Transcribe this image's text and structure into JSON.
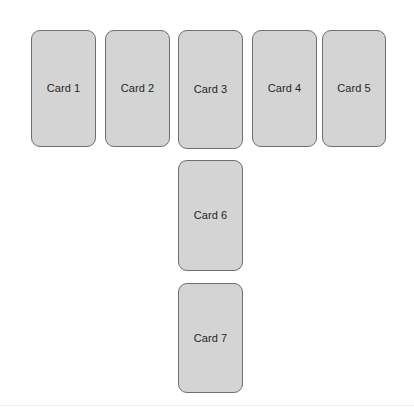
{
  "canvas": {
    "width": 414,
    "height": 417,
    "background_color": "#ffffff"
  },
  "style": {
    "card_fill_color": "#d4d4d4",
    "card_border_color": "#6f6f6f",
    "card_text_color": "#262626",
    "divider_color": "#f0f0f0"
  },
  "layout": {
    "top_row_count": 5,
    "column_count": 2,
    "description": "Five cards in a horizontal row with two additional cards stacked vertically below the third card, forming a T shape."
  },
  "cards": [
    {
      "label": "Card 1",
      "row": "top",
      "index": 1
    },
    {
      "label": "Card 2",
      "row": "top",
      "index": 2
    },
    {
      "label": "Card 3",
      "row": "top",
      "index": 3
    },
    {
      "label": "Card 4",
      "row": "top",
      "index": 4
    },
    {
      "label": "Card 5",
      "row": "top",
      "index": 5
    },
    {
      "label": "Card 6",
      "row": "column",
      "index": 6
    },
    {
      "label": "Card 7",
      "row": "column",
      "index": 7
    }
  ]
}
